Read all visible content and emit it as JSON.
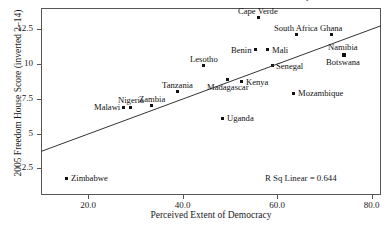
{
  "chart_data": {
    "type": "scatter",
    "title": "FIGURE 2. EXTENT OF DEMOCRACY, 2005",
    "xlabel": "Perceived Extent of Democracy",
    "ylabel": "2005 Freedom House Score (inverted 2–14)",
    "xlim": [
      10.0,
      82.0
    ],
    "ylim": [
      0.6,
      14.0
    ],
    "xticks": [
      20.0,
      40.0,
      60.0,
      80.0
    ],
    "xtick_labels": [
      "20.0",
      "40.0",
      "60.0",
      "80.0"
    ],
    "yticks": [
      2.5,
      5,
      7.5,
      10,
      12.5
    ],
    "ytick_labels": [
      "2.5",
      "5",
      "7.5",
      "10",
      "12.5"
    ],
    "grid": false,
    "legend": null,
    "annotation": "R Sq Linear = 0.644",
    "r_squared": 0.644,
    "fit_line": {
      "x": [
        10.0,
        82.0
      ],
      "y": [
        3.72,
        12.73
      ]
    },
    "points": [
      {
        "label": "Zimbabwe",
        "x": 15.5,
        "y": 1.8,
        "label_pos": "right"
      },
      {
        "label": "Malawi",
        "x": 27.5,
        "y": 6.9,
        "label_pos": "left"
      },
      {
        "label": "Nigeria",
        "x": 29.0,
        "y": 6.9,
        "label_pos": "above"
      },
      {
        "label": "Zambia",
        "x": 33.5,
        "y": 7.0,
        "label_pos": "above"
      },
      {
        "label": "Tanzania",
        "x": 39.0,
        "y": 8.0,
        "label_pos": "above"
      },
      {
        "label": "Lesotho",
        "x": 44.5,
        "y": 9.85,
        "label_pos": "above"
      },
      {
        "label": "Uganda",
        "x": 48.5,
        "y": 6.1,
        "label_pos": "right"
      },
      {
        "label": "Madagascar",
        "x": 49.5,
        "y": 8.9,
        "label_pos": "below"
      },
      {
        "label": "Kenya",
        "x": 52.5,
        "y": 8.7,
        "label_pos": "right"
      },
      {
        "label": "Benin",
        "x": 55.5,
        "y": 11.0,
        "label_pos": "left"
      },
      {
        "label": "Cape Verde",
        "x": 56.0,
        "y": 13.3,
        "label_pos": "above"
      },
      {
        "label": "Mali",
        "x": 58.0,
        "y": 11.0,
        "label_pos": "right"
      },
      {
        "label": "Senegal",
        "x": 59.0,
        "y": 9.85,
        "label_pos": "right"
      },
      {
        "label": "Mozambique",
        "x": 63.5,
        "y": 7.9,
        "label_pos": "right"
      },
      {
        "label": "South Africa",
        "x": 64.0,
        "y": 12.1,
        "label_pos": "above"
      },
      {
        "label": "Ghana",
        "x": 71.5,
        "y": 12.1,
        "label_pos": "above"
      },
      {
        "label": "Namibia",
        "x": 74.0,
        "y": 10.7,
        "label_pos": "above"
      },
      {
        "label": "Botswana",
        "x": 74.0,
        "y": 10.7,
        "label_pos": "below"
      }
    ]
  }
}
